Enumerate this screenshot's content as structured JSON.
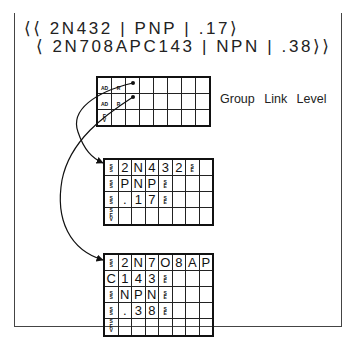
{
  "header": {
    "line1": "⟨⟨ 2N432 | PNP | .17⟩",
    "line2": "⟨ 2N708APC143 | NPN | .38⟩⟩"
  },
  "group_link_level": {
    "label": "Group Link Level",
    "rows": [
      [
        "AD",
        "R",
        "•",
        "",
        "",
        "",
        "",
        ""
      ],
      [
        "AD",
        "R",
        "•",
        "",
        "",
        "",
        "",
        ""
      ],
      [
        "EV",
        "",
        "",
        "",
        "",
        "",
        "",
        ""
      ]
    ]
  },
  "record_1": {
    "rows": [
      [
        "SS",
        "2",
        "N",
        "4",
        "3",
        "2",
        "SE",
        ""
      ],
      [
        "SS",
        "P",
        "N",
        "P",
        "SE",
        "",
        "",
        ""
      ],
      [
        "SS",
        ".",
        "1",
        "7",
        "SE",
        "",
        "",
        ""
      ],
      [
        "SEV",
        "",
        "",
        "",
        "",
        "",
        "",
        ""
      ]
    ]
  },
  "record_2": {
    "rows": [
      [
        "SS",
        "2",
        "N",
        "7",
        "O",
        "8",
        "A",
        "P"
      ],
      [
        "C",
        "1",
        "4",
        "3",
        "SE",
        "",
        "",
        ""
      ],
      [
        "SS",
        "N",
        "P",
        "N",
        "SE",
        "",
        "",
        ""
      ],
      [
        "SS",
        ".",
        "3",
        "8",
        "SE",
        "",
        "",
        ""
      ],
      [
        "SEV",
        "",
        "",
        "",
        "",
        "",
        "",
        ""
      ]
    ]
  }
}
